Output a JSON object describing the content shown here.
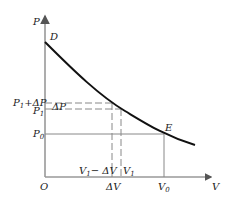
{
  "diagram": {
    "type": "P-V curve",
    "axes": {
      "y_label": "P",
      "x_label": "V",
      "origin_label": "O"
    },
    "points": {
      "start": "D",
      "equilibrium": "E"
    },
    "y_ticks": {
      "p1_plus_dp": {
        "base": "P",
        "sub": "1",
        "rest": "+ΔP"
      },
      "p1": {
        "base": "P",
        "sub": "1"
      },
      "p0": {
        "base": "P",
        "sub": "0"
      }
    },
    "x_ticks": {
      "v1_minus_dv": {
        "base": "V",
        "sub": "1",
        "rest": "− ΔV"
      },
      "v1": {
        "base": "V",
        "sub": "1"
      },
      "v0": {
        "base": "V",
        "sub": "0"
      },
      "dv": "ΔV"
    },
    "annotations": {
      "dp": "ΔP"
    },
    "colors": {
      "curve": "#111111",
      "axis": "#999999",
      "guide": "#888888"
    }
  }
}
